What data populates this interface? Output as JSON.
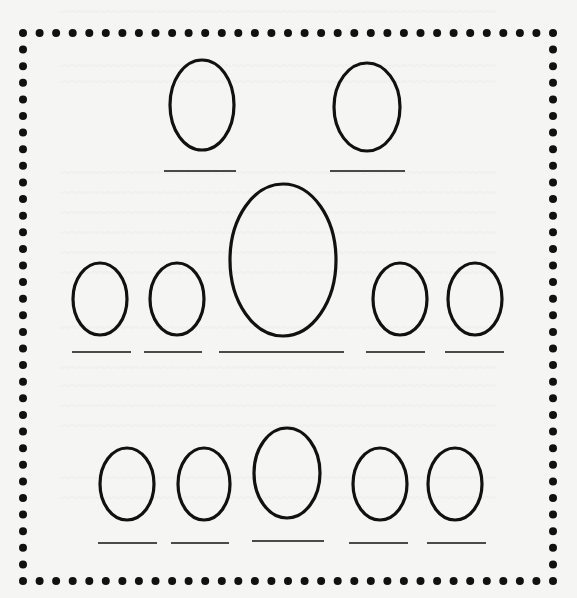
{
  "worksheet": {
    "title": "Family tree blank worksheet",
    "background_color": "#f5f5f3",
    "ink_color": "#111111",
    "border": {
      "style": "dotted",
      "left": 23,
      "top": 33,
      "right": 553,
      "bottom": 581,
      "dot_radius": 4,
      "spacing": 16.5
    },
    "rows": [
      {
        "name": "top-row",
        "ovals": [
          {
            "cx": 202,
            "cy": 105,
            "rx": 32,
            "ry": 45
          },
          {
            "cx": 367,
            "cy": 107,
            "rx": 33,
            "ry": 44
          }
        ],
        "name_lines": [
          {
            "x1": 164,
            "x2": 236,
            "y": 171
          },
          {
            "x1": 330,
            "x2": 405,
            "y": 171
          }
        ]
      },
      {
        "name": "middle-row",
        "ovals": [
          {
            "cx": 100,
            "cy": 299,
            "rx": 27,
            "ry": 36
          },
          {
            "cx": 177,
            "cy": 299,
            "rx": 27,
            "ry": 36
          },
          {
            "cx": 283,
            "cy": 260,
            "rx": 53,
            "ry": 76
          },
          {
            "cx": 400,
            "cy": 299,
            "rx": 27,
            "ry": 36
          },
          {
            "cx": 475,
            "cy": 299,
            "rx": 27,
            "ry": 36
          }
        ],
        "name_lines": [
          {
            "x1": 72,
            "x2": 131,
            "y": 352
          },
          {
            "x1": 144,
            "x2": 202,
            "y": 352
          },
          {
            "x1": 219,
            "x2": 344,
            "y": 352
          },
          {
            "x1": 366,
            "x2": 425,
            "y": 352
          },
          {
            "x1": 445,
            "x2": 504,
            "y": 352
          }
        ]
      },
      {
        "name": "bottom-row",
        "ovals": [
          {
            "cx": 127,
            "cy": 484,
            "rx": 27,
            "ry": 36
          },
          {
            "cx": 204,
            "cy": 484,
            "rx": 26,
            "ry": 36
          },
          {
            "cx": 287,
            "cy": 473,
            "rx": 33,
            "ry": 45
          },
          {
            "cx": 380,
            "cy": 484,
            "rx": 27,
            "ry": 36
          },
          {
            "cx": 455,
            "cy": 484,
            "rx": 27,
            "ry": 36
          }
        ],
        "name_lines": [
          {
            "x1": 98,
            "x2": 157,
            "y": 543
          },
          {
            "x1": 171,
            "x2": 229,
            "y": 543
          },
          {
            "x1": 252,
            "x2": 324,
            "y": 541
          },
          {
            "x1": 349,
            "x2": 408,
            "y": 543
          },
          {
            "x1": 427,
            "x2": 486,
            "y": 543
          }
        ]
      }
    ]
  }
}
